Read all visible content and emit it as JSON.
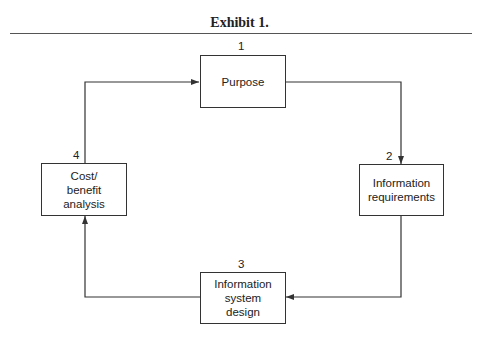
{
  "title": "Exhibit 1.",
  "nodes": [
    {
      "id": 1,
      "number": "1",
      "label": "Purpose"
    },
    {
      "id": 2,
      "number": "2",
      "label": "Information requirements"
    },
    {
      "id": 3,
      "number": "3",
      "label": "Information system design"
    },
    {
      "id": 4,
      "number": "4",
      "label": "Cost/ benefit analysis"
    }
  ],
  "edges": [
    {
      "from": 1,
      "to": 2
    },
    {
      "from": 2,
      "to": 3
    },
    {
      "from": 3,
      "to": 4
    },
    {
      "from": 4,
      "to": 1
    }
  ],
  "colors": {
    "line": "#333333",
    "text": "#222222"
  }
}
